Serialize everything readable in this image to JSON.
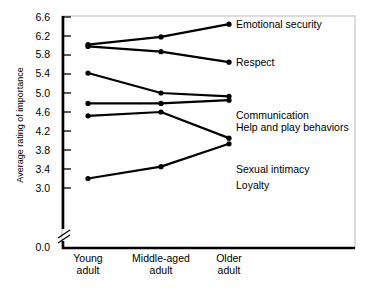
{
  "chart_data": {
    "type": "line",
    "title": "",
    "xlabel": "",
    "ylabel": "Average rating of importance",
    "categories": [
      "Young\nadult",
      "Middle-aged\nadult",
      "Older\nadult"
    ],
    "category_labels": [
      {
        "line1": "Young",
        "line2": "adult"
      },
      {
        "line1": "Middle-aged",
        "line2": "adult"
      },
      {
        "line1": "Older",
        "line2": "adult"
      }
    ],
    "ylim": [
      3.0,
      6.6
    ],
    "yticks": [
      "6.6",
      "6.2",
      "5.8",
      "5.4",
      "5.0",
      "4.6",
      "4.2",
      "3.8",
      "3.4",
      "3.0",
      "0.0"
    ],
    "ytick_values": [
      6.6,
      6.2,
      5.8,
      5.4,
      5.0,
      4.6,
      4.2,
      3.8,
      3.4,
      3.0,
      0.0
    ],
    "axis_break": true,
    "grid": false,
    "legend_position": "right-inline-labels",
    "series": [
      {
        "name": "Emotional security",
        "values": [
          6.02,
          6.18,
          6.45
        ]
      },
      {
        "name": "Respect",
        "values": [
          5.98,
          5.87,
          5.65
        ]
      },
      {
        "name": "Communication",
        "values": [
          5.42,
          5.0,
          4.93
        ]
      },
      {
        "name": "Help and play behaviors",
        "values": [
          4.78,
          4.78,
          4.85
        ]
      },
      {
        "name": "Sexual intimacy",
        "values": [
          4.52,
          4.6,
          4.05
        ]
      },
      {
        "name": "Loyalty",
        "values": [
          3.2,
          3.45,
          3.93
        ]
      }
    ]
  },
  "colors": {
    "line": "#000000",
    "marker": "#000000",
    "axis": "#000000",
    "background": "#ffffff",
    "frame": "#b9b9b9"
  }
}
